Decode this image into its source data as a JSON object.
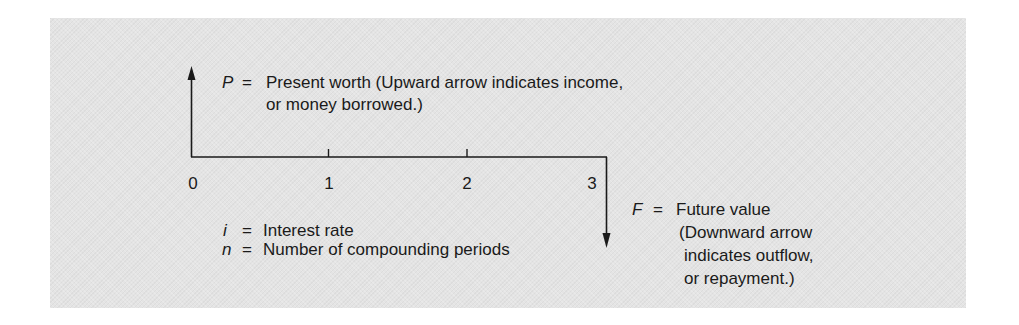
{
  "diagram": {
    "type": "cash-flow-diagram",
    "colors": {
      "panel_background": "#e4e4e4",
      "line": "#1a1a1a",
      "text": "#1a1a1a"
    },
    "timeline": {
      "tick_labels": [
        "0",
        "1",
        "2",
        "3"
      ]
    },
    "present_worth": {
      "symbol": "P",
      "equals": "=",
      "line1": "Present worth (Upward arrow indicates income,",
      "line2": "or money borrowed.)",
      "arrow_direction": "up"
    },
    "future_value": {
      "symbol": "F",
      "equals": "=",
      "line1": "Future value",
      "line2": "(Downward arrow",
      "line3": "indicates outflow,",
      "line4": "or repayment.)",
      "arrow_direction": "down"
    },
    "legend": [
      {
        "symbol": "i",
        "equals": "=",
        "text": "Interest rate"
      },
      {
        "symbol": "n",
        "equals": "=",
        "text": "Number of compounding periods"
      }
    ]
  }
}
